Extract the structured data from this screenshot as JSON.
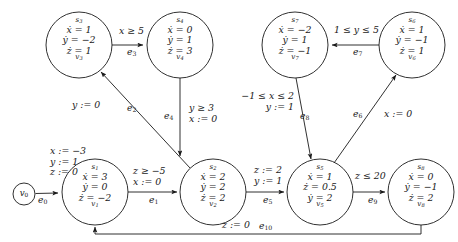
{
  "diagram": {
    "type": "hybrid-automaton-graph",
    "title": "",
    "stroke_color": "#1a1a1a",
    "background": "#ffffff"
  },
  "initial_node": {
    "name": "v",
    "sub": "0",
    "cx": 24,
    "cy": 194,
    "r": 11
  },
  "initial_assignment": {
    "lines": [
      "x := −3",
      "y := 1",
      "z := 0"
    ],
    "x": 50,
    "y": 148
  },
  "nodes": [
    {
      "id": "v1",
      "state": "s",
      "state_sub": "1",
      "name": "v",
      "name_sub": "1",
      "cx": 95,
      "cy": 192,
      "r": 33,
      "flows": [
        "ẋ = 3",
        "ẏ = 0",
        "ż = −2"
      ]
    },
    {
      "id": "v2",
      "state": "s",
      "state_sub": "2",
      "name": "v",
      "name_sub": "2",
      "cx": 213,
      "cy": 192,
      "r": 33,
      "flows": [
        "ẋ = 2",
        "ẏ = 2",
        "ż = 2"
      ]
    },
    {
      "id": "v3",
      "state": "s",
      "state_sub": "3",
      "name": "v",
      "name_sub": "3",
      "cx": 79,
      "cy": 45,
      "r": 33,
      "flows": [
        "ẋ = 1",
        "ẏ = −2",
        "ż = 1"
      ]
    },
    {
      "id": "v4",
      "state": "s",
      "state_sub": "4",
      "name": "v",
      "name_sub": "4",
      "cx": 180,
      "cy": 45,
      "r": 33,
      "flows": [
        "ẋ = 0",
        "ẏ = 1",
        "ż = 3"
      ]
    },
    {
      "id": "v5",
      "state": "s",
      "state_sub": "5",
      "name": "v",
      "name_sub": "5",
      "cx": 320,
      "cy": 192,
      "r": 33,
      "flows": [
        "ẋ = 1",
        "ż = 0.5",
        "ẏ = 2"
      ]
    },
    {
      "id": "v6",
      "state": "s",
      "state_sub": "6",
      "name": "v",
      "name_sub": "6",
      "cx": 412,
      "cy": 45,
      "r": 33,
      "flows": [
        "ẋ = 1",
        "ẏ = −1",
        "ż = 1"
      ]
    },
    {
      "id": "v7",
      "state": "s",
      "state_sub": "7",
      "name": "v",
      "name_sub": "7",
      "cx": 295,
      "cy": 45,
      "r": 33,
      "flows": [
        "ẋ = −2",
        "ẏ = 1",
        "ż = −1"
      ]
    },
    {
      "id": "v8",
      "state": "s",
      "state_sub": "8",
      "name": "v",
      "name_sub": "8",
      "cx": 421,
      "cy": 192,
      "r": 33,
      "flows": [
        "ẋ = 0",
        "ẏ = −1",
        "ż = 2"
      ]
    }
  ],
  "edges": [
    {
      "id": "e0",
      "name": "e",
      "sub": "0",
      "from": "v0",
      "to": "v1",
      "guard_lines": [],
      "label_x": 38,
      "label_y": 196
    },
    {
      "id": "e1",
      "name": "e",
      "sub": "1",
      "from": "v1",
      "to": "v2",
      "guard_lines": [
        "z ≥ −5",
        "x := 0"
      ],
      "guard_x": 133,
      "guard_y": 170,
      "label_x": 149,
      "label_y": 196
    },
    {
      "id": "e2",
      "name": "e",
      "sub": "2",
      "from": "v2",
      "to": "v3",
      "guard_lines": [
        "y := 0"
      ],
      "guard_x": 72,
      "guard_y": 103,
      "label_x": 127,
      "label_y": 104
    },
    {
      "id": "e3",
      "name": "e",
      "sub": "3",
      "from": "v3",
      "to": "v4",
      "guard_lines": [
        "x ≥ 5"
      ],
      "guard_x": 119,
      "guard_y": 29,
      "label_x": 127,
      "label_y": 48
    },
    {
      "id": "e4",
      "name": "e",
      "sub": "4",
      "from": "v4",
      "to": "v2",
      "guard_lines": [
        "y ≥ 3",
        "x := 0"
      ],
      "guard_x": 189,
      "guard_y": 106,
      "label_x": 166,
      "label_y": 113
    },
    {
      "id": "e5",
      "name": "e",
      "sub": "5",
      "from": "v2",
      "to": "v5",
      "guard_lines": [
        "z := 2",
        "y := 1"
      ],
      "guard_x": 254,
      "guard_y": 168,
      "label_x": 263,
      "label_y": 196
    },
    {
      "id": "e6",
      "name": "e",
      "sub": "6",
      "from": "v5",
      "to": "v6",
      "guard_lines": [
        "x := 0"
      ],
      "guard_x": 384,
      "guard_y": 112,
      "label_x": 355,
      "label_y": 111
    },
    {
      "id": "e7",
      "name": "e",
      "sub": "7",
      "from": "v6",
      "to": "v7",
      "guard_lines": [
        "1 ≤ y ≤ 5"
      ],
      "guard_x": 334,
      "guard_y": 28,
      "label_x": 353,
      "label_y": 48
    },
    {
      "id": "e8",
      "name": "e",
      "sub": "8",
      "from": "v7",
      "to": "v5",
      "guard_lines": [
        "−1 ≤ x ≤ 2",
        "y := 1"
      ],
      "guard_x": 236,
      "guard_y": 94,
      "label_x": 302,
      "label_y": 113
    },
    {
      "id": "e9",
      "name": "e",
      "sub": "9",
      "from": "v5",
      "to": "v8",
      "guard_lines": [
        "z ≤ 20"
      ],
      "guard_x": 355,
      "guard_y": 174,
      "label_x": 368,
      "label_y": 196
    },
    {
      "id": "e10",
      "name": "e",
      "sub": "10",
      "from": "v8",
      "to": "v1",
      "guard_lines": [
        "z := 0"
      ],
      "guard_x": 222,
      "guard_y": 223,
      "label_x": 263,
      "label_y": 223
    }
  ]
}
